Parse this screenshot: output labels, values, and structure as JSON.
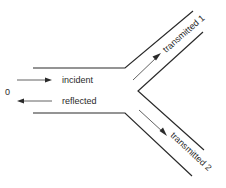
{
  "diagram": {
    "title": "",
    "origin_label": "0",
    "labels": {
      "incident": "incident",
      "reflected": "reflected",
      "transmitted_1": "transmitted 1",
      "transmitted_2": "transmitted 2"
    },
    "colors": {
      "line": "#2a2a2a",
      "background": "#ffffff"
    },
    "nodes": [
      {
        "id": "input_channel",
        "label": "input channel (incident / reflected)"
      },
      {
        "id": "branch_1",
        "label": "transmitted 1"
      },
      {
        "id": "branch_2",
        "label": "transmitted 2"
      }
    ],
    "edges": [
      {
        "from": "input_channel",
        "to": "branch_1",
        "label": "transmitted 1"
      },
      {
        "from": "input_channel",
        "to": "branch_2",
        "label": "transmitted 2"
      }
    ]
  }
}
